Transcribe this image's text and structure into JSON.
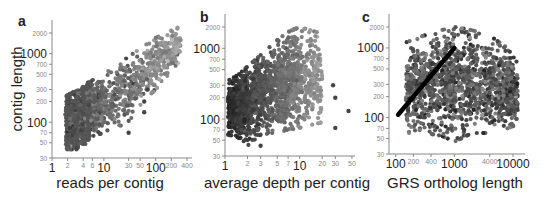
{
  "figure": {
    "panels": [
      "a",
      "b",
      "c"
    ]
  },
  "chart_data": [
    {
      "panel_label": "a",
      "type": "scatter",
      "title": "",
      "xlabel": "reads per contig",
      "ylabel": "contig length",
      "xscale": "log",
      "yscale": "log",
      "xlim": [
        1,
        500
      ],
      "ylim": [
        30,
        2700
      ],
      "x_ticks": [
        1,
        2,
        4,
        6,
        10,
        30,
        50,
        100,
        200,
        400
      ],
      "x_tick_labels": [
        "1",
        "2",
        "4",
        "6",
        "10",
        "30",
        "50",
        "100",
        "200",
        "400"
      ],
      "y_ticks": [
        30,
        50,
        70,
        100,
        200,
        300,
        500,
        700,
        1000,
        2000
      ],
      "y_tick_labels": [
        "30",
        "50",
        "70",
        "100",
        "200",
        "300",
        "500",
        "700",
        "1000",
        "2000"
      ],
      "grid": false,
      "legend": null,
      "description": "Dense point cloud; discrete columns at x=2,3,4,5 spanning ~40-380; positive log-log trend up to ~2000 length at ~300 reads; grayscale shading by density",
      "trend_points": {
        "x": [
          2,
          3,
          5,
          10,
          30,
          100,
          300
        ],
        "y_low": [
          40,
          40,
          60,
          70,
          100,
          300,
          800
        ],
        "y_high": [
          250,
          290,
          380,
          500,
          900,
          1700,
          2500
        ]
      },
      "outliers": [
        {
          "x": 60,
          "y": 140
        },
        {
          "x": 60,
          "y": 200
        },
        {
          "x": 70,
          "y": 300
        },
        {
          "x": 30,
          "y": 70
        },
        {
          "x": 3,
          "y": 42
        }
      ]
    },
    {
      "panel_label": "b",
      "type": "scatter",
      "title": "",
      "xlabel": "average depth per contig",
      "ylabel": "",
      "xscale": "log",
      "yscale": "log",
      "xlim": [
        1,
        55
      ],
      "ylim": [
        30,
        2700
      ],
      "x_ticks": [
        1,
        2,
        3,
        5,
        7,
        10,
        20,
        30,
        50
      ],
      "x_tick_labels": [
        "1",
        "2",
        "3",
        "5",
        "7",
        "10",
        "20",
        "30",
        "50"
      ],
      "y_ticks": [
        30,
        50,
        70,
        100,
        200,
        300,
        500,
        700,
        1000,
        2000
      ],
      "y_tick_labels": [
        "30",
        "50",
        "70",
        "100",
        "200",
        "300",
        "500",
        "700",
        "1000",
        "2000"
      ],
      "grid": false,
      "legend": null,
      "description": "Dense cloud starting at depth 1 with lengths ~50-350, widening upward to ~2000 by depth 5-15; vertical bands of gray shading; sparse outliers at depth 20-50",
      "trend_points": {
        "x": [
          1.1,
          1.5,
          2,
          3,
          5,
          7,
          10,
          20
        ],
        "y_low": [
          60,
          55,
          42,
          60,
          65,
          70,
          75,
          90
        ],
        "y_high": [
          350,
          420,
          550,
          800,
          1300,
          1700,
          2000,
          1600
        ]
      },
      "outliers": [
        {
          "x": 45,
          "y": 130
        },
        {
          "x": 30,
          "y": 200
        },
        {
          "x": 28,
          "y": 300
        },
        {
          "x": 30,
          "y": 75
        },
        {
          "x": 3,
          "y": 42
        }
      ]
    },
    {
      "panel_label": "c",
      "type": "scatter",
      "title": "",
      "xlabel": "GRS ortholog length",
      "ylabel": "",
      "xscale": "log",
      "yscale": "log",
      "xlim": [
        90,
        16000
      ],
      "ylim": [
        30,
        2700
      ],
      "x_ticks": [
        100,
        200,
        400,
        1000,
        4000,
        10000
      ],
      "x_tick_labels": [
        "100",
        "200",
        "400",
        "1000",
        "4000",
        "10000"
      ],
      "y_ticks": [
        30,
        50,
        70,
        100,
        200,
        300,
        500,
        700,
        1000,
        2000
      ],
      "y_tick_labels": [
        "30",
        "50",
        "70",
        "100",
        "200",
        "300",
        "500",
        "700",
        "1000",
        "2000"
      ],
      "grid": false,
      "legend": null,
      "description": "Broad diffuse cloud of contig length vs ortholog length; most points 60-1500 contig length across ortholog length 150-12000; thick black diagonal y=x reference line from (110,110) to (1000,1000)",
      "reference_line": {
        "x": [
          110,
          1000
        ],
        "y": [
          110,
          1000
        ],
        "color": "#000000",
        "label": "y = x"
      },
      "trend_points": {
        "x": [
          150,
          300,
          600,
          1000,
          2000,
          4000,
          8000,
          12000
        ],
        "y_low": [
          60,
          60,
          55,
          45,
          60,
          60,
          70,
          80
        ],
        "y_high": [
          1200,
          1500,
          1800,
          2000,
          1800,
          1500,
          1000,
          600
        ]
      }
    }
  ]
}
